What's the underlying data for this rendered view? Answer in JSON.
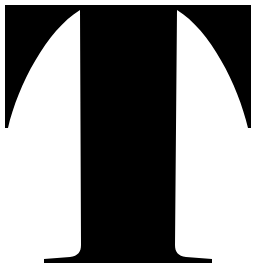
{
  "glyph": {
    "character": "T",
    "style": "serif",
    "color": "#000000",
    "background": "#ffffff"
  }
}
